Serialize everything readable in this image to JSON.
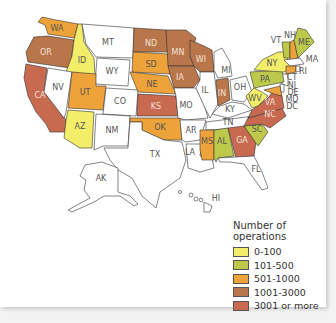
{
  "legend": {
    "title": "Number of operations",
    "items": [
      {
        "label": "0-100",
        "color": "#f3ee6a"
      },
      {
        "label": "101-500",
        "color": "#bcc94a"
      },
      {
        "label": "501-1000",
        "color": "#eea33a"
      },
      {
        "label": "1001-3000",
        "color": "#b8764a"
      },
      {
        "label": "3001 or more",
        "color": "#c86a50"
      }
    ]
  },
  "states": {
    "WA": "501-1000",
    "OR": "1001-3000",
    "CA": "3001 or more",
    "ID": "0-100",
    "NV": "none",
    "MT": "none",
    "WY": "none",
    "UT": "501-1000",
    "AZ": "0-100",
    "CO": "none",
    "NM": "none",
    "ND": "1001-3000",
    "SD": "501-1000",
    "NE": "501-1000",
    "KS": "3001 or more",
    "OK": "501-1000",
    "TX": "none",
    "MN": "1001-3000",
    "IA": "1001-3000",
    "MO": "none",
    "AR": "none",
    "LA": "none",
    "WI": "1001-3000",
    "IL": "none",
    "MI": "none",
    "IN": "1001-3000",
    "OH": "none",
    "KY": "none",
    "TN": "none",
    "MS": "501-1000",
    "AL": "101-500",
    "GA": "3001 or more",
    "FL": "none",
    "SC": "101-500",
    "NC": "3001 or more",
    "VA": "3001 or more",
    "WV": "0-100",
    "PA": "101-500",
    "NY": "0-100",
    "VT": "101-500",
    "NH": "501-1000",
    "ME": "101-500",
    "MA": "none",
    "CT": "501-1000",
    "RI": "none",
    "NJ": "none",
    "DE": "none",
    "MD": "501-1000",
    "DC": "none",
    "AK": "none",
    "HI": "none"
  },
  "labels": [
    "WA",
    "OR",
    "CA",
    "ID",
    "NV",
    "MT",
    "WY",
    "UT",
    "AZ",
    "CO",
    "NM",
    "ND",
    "SD",
    "NE",
    "KS",
    "OK",
    "TX",
    "MN",
    "IA",
    "MO",
    "AR",
    "LA",
    "WI",
    "IL",
    "MI",
    "IN",
    "OH",
    "KY",
    "TN",
    "MS",
    "AL",
    "GA",
    "FL",
    "SC",
    "NC",
    "VA",
    "WV",
    "PA",
    "NY",
    "VT",
    "NH",
    "ME",
    "MA",
    "CT",
    "RI",
    "NJ",
    "DE",
    "MD",
    "DC",
    "AK",
    "HI"
  ]
}
